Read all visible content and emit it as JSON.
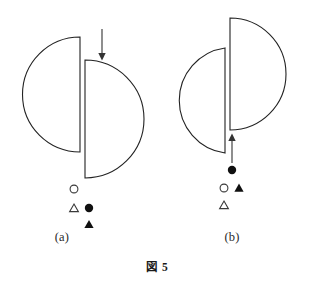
{
  "figure": {
    "caption": "図 5",
    "panels": [
      {
        "id": "a",
        "label": "(a)",
        "arrow": {
          "direction": "down",
          "name": "down-arrow",
          "x": 102,
          "y_start": 29,
          "y_end": 60
        },
        "shapes": [
          {
            "name": "left-half-disc",
            "orientation": "opens-left",
            "flat_edge_side": "right",
            "cx": 80,
            "cy": 94.5,
            "r": 57,
            "top": 37,
            "bottom": 152
          },
          {
            "name": "right-half-disc",
            "orientation": "opens-right",
            "flat_edge_side": "left",
            "cx": 85,
            "cy": 119,
            "r": 59,
            "top": 60,
            "bottom": 178
          }
        ],
        "markers": [
          {
            "row": 0,
            "name": "open-circle",
            "symbol": "circle",
            "fill": "open",
            "x": 74,
            "y": 189
          },
          {
            "row": 1,
            "name": "open-triangle",
            "symbol": "triangle",
            "fill": "open",
            "x": 74,
            "y": 208
          },
          {
            "row": 1,
            "name": "filled-circle",
            "symbol": "circle",
            "fill": "filled",
            "x": 89,
            "y": 208
          },
          {
            "row": 2,
            "name": "filled-triangle",
            "symbol": "triangle",
            "fill": "filled",
            "x": 89,
            "y": 224
          }
        ]
      },
      {
        "id": "b",
        "label": "(b)",
        "arrow": {
          "direction": "up",
          "name": "up-arrow",
          "x": 77,
          "y_start": 163,
          "y_end": 134
        },
        "shapes": [
          {
            "name": "left-half-disc",
            "orientation": "opens-left",
            "flat_edge_side": "right",
            "cx": 70,
            "cy": 100.5,
            "r": 53,
            "top": 48,
            "bottom": 153
          },
          {
            "name": "right-half-disc",
            "orientation": "opens-right",
            "flat_edge_side": "left",
            "cx": 75,
            "cy": 74,
            "r": 56,
            "top": 18,
            "bottom": 130
          }
        ],
        "markers": [
          {
            "row": 0,
            "name": "filled-circle",
            "symbol": "circle",
            "fill": "filled",
            "x": 77,
            "y": 170
          },
          {
            "row": 1,
            "name": "open-circle",
            "symbol": "circle",
            "fill": "open",
            "x": 69,
            "y": 188
          },
          {
            "row": 1,
            "name": "filled-triangle",
            "symbol": "triangle",
            "fill": "filled",
            "x": 84,
            "y": 188
          },
          {
            "row": 2,
            "name": "open-triangle",
            "symbol": "triangle",
            "fill": "open",
            "x": 69,
            "y": 205
          }
        ]
      }
    ],
    "colors": {
      "stroke": "#222222",
      "background": "#ffffff",
      "text": "#1a1a1a"
    }
  }
}
